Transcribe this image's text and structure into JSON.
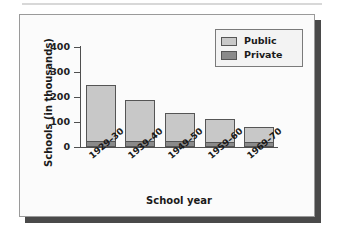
{
  "figure": {
    "panel_background": "#fbfbfb",
    "panel_border_color": "#9a9a9a",
    "shadow_color": "#4a4a4a"
  },
  "chart_data": {
    "type": "bar",
    "stacked": true,
    "title": "",
    "xlabel": "School year",
    "ylabel": "Schools (in thousands)",
    "categories": [
      "1929–30",
      "1939–40",
      "1949–50",
      "1959–60",
      "1969–70"
    ],
    "series": [
      {
        "name": "Private",
        "color": "#8a8a8a",
        "values": [
          25,
          25,
          23,
          22,
          19
        ]
      },
      {
        "name": "Public",
        "color": "#c8c8c8",
        "values": [
          225,
          163,
          113,
          91,
          63
        ]
      }
    ],
    "totals": [
      250,
      188,
      136,
      113,
      82
    ],
    "ylim": [
      0,
      400
    ],
    "yticks": [
      0,
      100,
      200,
      300,
      400
    ],
    "ytick_labels": [
      "0",
      "100",
      "200",
      "300",
      "400"
    ],
    "grid": false,
    "legend_position": "top-right"
  },
  "legend": {
    "items": [
      {
        "label": "Public",
        "color": "#c8c8c8"
      },
      {
        "label": "Private",
        "color": "#8a8a8a"
      }
    ]
  }
}
